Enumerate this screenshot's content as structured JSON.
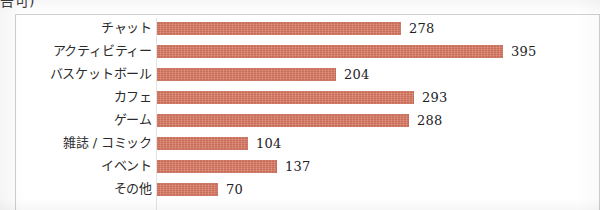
{
  "clipped_header_text": "告可)",
  "chart_data": {
    "type": "bar",
    "orientation": "horizontal",
    "title": "",
    "subtitle": "",
    "xlabel": "",
    "ylabel": "",
    "grid": false,
    "legend": null,
    "xlim": [
      0,
      395
    ],
    "bar_color": "#d1715c",
    "value_label_position": "outside-end",
    "categories": [
      "チャット",
      "アクティビティー",
      "バスケットボール",
      "カフェ",
      "ゲーム",
      "雑誌 / コミック",
      "イベント",
      "その他"
    ],
    "values": [
      278,
      395,
      204,
      293,
      288,
      104,
      137,
      70
    ],
    "rows": [
      {
        "category": "チャット",
        "value": 278,
        "value_label": "278"
      },
      {
        "category": "アクティビティー",
        "value": 395,
        "value_label": "395"
      },
      {
        "category": "バスケットボール",
        "value": 204,
        "value_label": "204"
      },
      {
        "category": "カフェ",
        "value": 293,
        "value_label": "293"
      },
      {
        "category": "ゲーム",
        "value": 288,
        "value_label": "288"
      },
      {
        "category": "雑誌 / コミック",
        "value": 104,
        "value_label": "104"
      },
      {
        "category": "イベント",
        "value": 137,
        "value_label": "137"
      },
      {
        "category": "その他",
        "value": 70,
        "value_label": "70"
      }
    ]
  }
}
